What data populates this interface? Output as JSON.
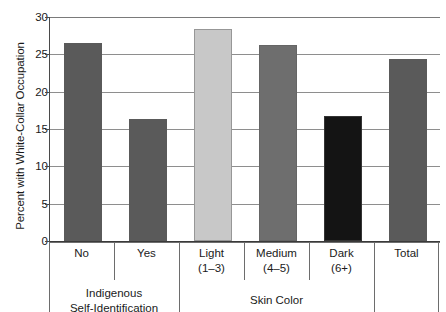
{
  "chart_data": {
    "type": "bar",
    "title": "",
    "subtitle": "",
    "xlabel": "",
    "ylabel": "Percent with White-Collar Occupation",
    "ylim": [
      0,
      30
    ],
    "ytick_values": [
      0,
      5,
      10,
      15,
      20,
      25,
      30
    ],
    "ytick_labels": [
      "0",
      "5",
      "10",
      "15",
      "20",
      "25",
      "30"
    ],
    "grid": true,
    "legend": "none",
    "categories": [
      "No",
      "Yes",
      "Light",
      "Medium",
      "Dark",
      "Total"
    ],
    "category_sublabels": [
      "",
      "",
      "(1–3)",
      "(4–5)",
      "(6+)",
      ""
    ],
    "values": [
      26.5,
      16.4,
      28.4,
      26.2,
      16.8,
      24.4
    ],
    "bar_colors": [
      "#5a5a5a",
      "#5a5a5a",
      "#c8c8c8",
      "#6e6e6e",
      "#141414",
      "#5a5a5a"
    ],
    "groups": [
      {
        "label": "Indigenous\nSelf-Identification",
        "line1": "Indigenous",
        "line2": "Self-Identification",
        "members": [
          "No",
          "Yes"
        ]
      },
      {
        "label": "Skin Color",
        "line1": "Skin Color",
        "line2": "",
        "members": [
          "Light",
          "Medium",
          "Dark"
        ]
      },
      {
        "label": "",
        "line1": "",
        "line2": "",
        "members": [
          "Total"
        ]
      }
    ]
  },
  "figure": {
    "background": "#ffffff",
    "axis_color": "#3a3a3a",
    "gridline_color": "#8e8e8e",
    "text_color": "#1a1a1a"
  }
}
